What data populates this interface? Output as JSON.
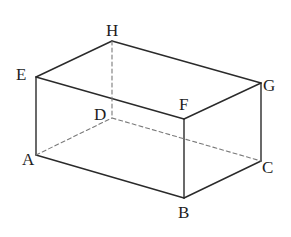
{
  "figure": {
    "type": "rectangular cuboid",
    "vertices": [
      "A",
      "B",
      "C",
      "D",
      "E",
      "F",
      "G",
      "H"
    ],
    "edges": [
      {
        "from": "E",
        "to": "H",
        "style": "solid"
      },
      {
        "from": "H",
        "to": "G",
        "style": "solid"
      },
      {
        "from": "E",
        "to": "F",
        "style": "solid"
      },
      {
        "from": "F",
        "to": "G",
        "style": "solid"
      },
      {
        "from": "E",
        "to": "A",
        "style": "solid"
      },
      {
        "from": "F",
        "to": "B",
        "style": "solid"
      },
      {
        "from": "G",
        "to": "C",
        "style": "solid"
      },
      {
        "from": "A",
        "to": "B",
        "style": "solid"
      },
      {
        "from": "B",
        "to": "C",
        "style": "solid"
      },
      {
        "from": "H",
        "to": "D",
        "style": "dashed"
      },
      {
        "from": "A",
        "to": "D",
        "style": "dashed"
      },
      {
        "from": "D",
        "to": "C",
        "style": "dashed"
      }
    ]
  },
  "labels": {
    "A": "A",
    "B": "B",
    "C": "C",
    "D": "D",
    "E": "E",
    "F": "F",
    "G": "G",
    "H": "H"
  },
  "colors": {
    "solid_edge": "#2a2a2a",
    "hidden_edge": "#7a7a7a",
    "label": "#1e1e1e"
  }
}
